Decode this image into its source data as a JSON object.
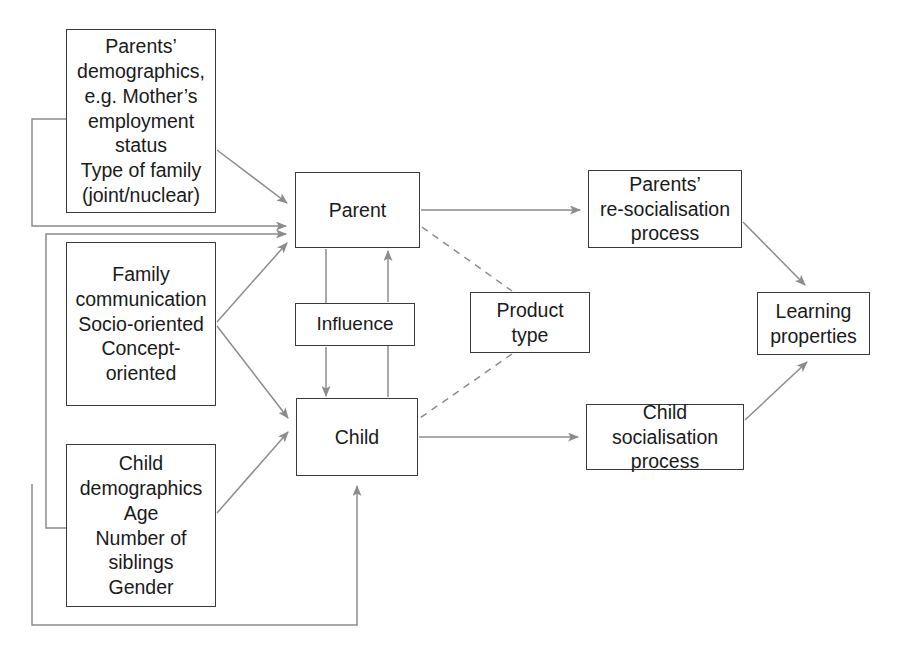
{
  "diagram": {
    "background_color": "#ffffff",
    "box_border_color": "#3a3a3a",
    "edge_color": "#8c8c8c",
    "text_color": "#1a1a1a"
  },
  "nodes": {
    "parents_demographics": {
      "label": "Parents’\ndemographics,\ne.g. Mother’s\nemployment\nstatus\nType of family\n(joint/nuclear)",
      "x": 66,
      "y": 29,
      "w": 150,
      "h": 184
    },
    "family_communication": {
      "label": "Family\ncommunication\nSocio-oriented\nConcept-oriented",
      "x": 66,
      "y": 242,
      "w": 150,
      "h": 164
    },
    "child_demographics": {
      "label": "Child\ndemographics\nAge\nNumber of\nsiblings\nGender",
      "x": 66,
      "y": 444,
      "w": 150,
      "h": 163
    },
    "parent": {
      "label": "Parent",
      "x": 295,
      "y": 172,
      "w": 125,
      "h": 76
    },
    "influence": {
      "label": "Influence",
      "x": 295,
      "y": 303,
      "w": 120,
      "h": 43
    },
    "child": {
      "label": "Child",
      "x": 296,
      "y": 398,
      "w": 122,
      "h": 78
    },
    "product_type": {
      "label": "Product\ntype",
      "x": 470,
      "y": 292,
      "w": 120,
      "h": 61
    },
    "parents_resocialisation": {
      "label": "Parents’\nre-socialisation\nprocess",
      "x": 588,
      "y": 170,
      "w": 154,
      "h": 78
    },
    "child_socialisation": {
      "label": "Child socialisation\nprocess",
      "x": 586,
      "y": 404,
      "w": 158,
      "h": 66
    },
    "learning_properties": {
      "label": "Learning\nproperties",
      "x": 757,
      "y": 292,
      "w": 113,
      "h": 63
    }
  },
  "edges": [
    {
      "name": "parents-demographics-to-parent",
      "from": "parents_demographics",
      "to": "parent",
      "style": "solid",
      "arrow": true
    },
    {
      "name": "family-communication-to-parent",
      "from": "family_communication",
      "to": "parent",
      "style": "solid",
      "arrow": true
    },
    {
      "name": "family-communication-to-child",
      "from": "family_communication",
      "to": "child",
      "style": "solid",
      "arrow": true
    },
    {
      "name": "child-demographics-to-child",
      "from": "child_demographics",
      "to": "child",
      "style": "solid",
      "arrow": true
    },
    {
      "name": "parent-to-influence",
      "from": "parent",
      "to": "influence",
      "style": "solid",
      "arrow": false
    },
    {
      "name": "influence-to-parent",
      "from": "influence",
      "to": "parent",
      "style": "solid",
      "arrow": true
    },
    {
      "name": "influence-to-child",
      "from": "influence",
      "to": "child",
      "style": "solid",
      "arrow": true
    },
    {
      "name": "child-to-influence",
      "from": "child",
      "to": "influence",
      "style": "solid",
      "arrow": false
    },
    {
      "name": "parent-to-parents-resocialisation",
      "from": "parent",
      "to": "parents_resocialisation",
      "style": "solid",
      "arrow": true
    },
    {
      "name": "child-to-child-socialisation",
      "from": "child",
      "to": "child_socialisation",
      "style": "solid",
      "arrow": true
    },
    {
      "name": "parents-resocialisation-to-learning-properties",
      "from": "parents_resocialisation",
      "to": "learning_properties",
      "style": "solid",
      "arrow": true
    },
    {
      "name": "child-socialisation-to-learning-properties",
      "from": "child_socialisation",
      "to": "learning_properties",
      "style": "solid",
      "arrow": true
    },
    {
      "name": "parent-to-product-type",
      "from": "parent",
      "to": "product_type",
      "style": "dashed",
      "arrow": false
    },
    {
      "name": "product-type-to-child",
      "from": "product_type",
      "to": "child",
      "style": "dashed",
      "arrow": false
    },
    {
      "name": "parents-demographics-feedback-to-parent",
      "from": "parents_demographics",
      "to": "parent",
      "style": "solid",
      "arrow": true,
      "routing": "left-loop"
    },
    {
      "name": "child-demographics-feedback-to-parent",
      "from": "child_demographics",
      "to": "parent",
      "style": "solid",
      "arrow": true,
      "routing": "left-loop"
    },
    {
      "name": "bottom-feedback-to-child",
      "from": "child_demographics",
      "to": "child",
      "style": "solid",
      "arrow": true,
      "routing": "bottom-loop"
    }
  ]
}
